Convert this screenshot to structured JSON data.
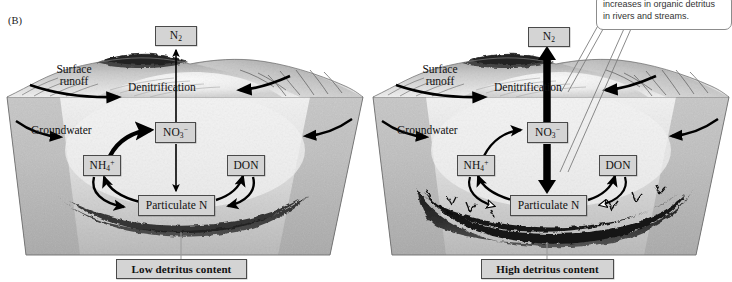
{
  "figure": {
    "panel_letter": "(B)",
    "background_color": "#ffffff",
    "box_fill": "#d4d4d4",
    "box_stroke": "#4a4a4a",
    "arrow_color": "#000000"
  },
  "callout": {
    "text": "increases in organic detritus in rivers and streams.",
    "line1": "increases in organic detritus",
    "line2": "in rivers and streams."
  },
  "panels": [
    {
      "id": "low-detritus",
      "caption": "Low detritus content",
      "detritus_level": "low",
      "labels": {
        "surface_runoff_line1": "Surface",
        "surface_runoff_line2": "runoff",
        "denitrification": "Denitrification",
        "groundwater": "Groundwater"
      },
      "pools": [
        {
          "name": "n2",
          "label": "N2",
          "html": "N<sub>2</sub>"
        },
        {
          "name": "nitrate",
          "label": "NO3-",
          "html": "NO<sub>3</sub><sup>−</sup>"
        },
        {
          "name": "ammonium",
          "label": "NH4+",
          "html": "NH<sub>4</sub><sup>+</sup>"
        },
        {
          "name": "don",
          "label": "DON",
          "html": "DON"
        },
        {
          "name": "particulate-n",
          "label": "Particulate N",
          "html": "Particulate N"
        }
      ],
      "flows": [
        {
          "from": "nitrate",
          "to": "n2",
          "weight": "thin"
        },
        {
          "from": "ammonium",
          "to": "nitrate",
          "weight": "thick"
        },
        {
          "from": "nitrate",
          "to": "particulate-n",
          "weight": "thin"
        },
        {
          "from": "particulate-n",
          "to": "ammonium",
          "weight": "thin"
        },
        {
          "from": "ammonium",
          "to": "particulate-n",
          "weight": "thin"
        },
        {
          "from": "particulate-n",
          "to": "don",
          "weight": "thin"
        },
        {
          "from": "don",
          "to": "particulate-n",
          "weight": "thin"
        }
      ]
    },
    {
      "id": "high-detritus",
      "caption": "High detritus content",
      "detritus_level": "high",
      "labels": {
        "surface_runoff_line1": "Surface",
        "surface_runoff_line2": "runoff",
        "denitrification": "Denitrification",
        "groundwater": "Groundwater"
      },
      "pools": [
        {
          "name": "n2",
          "label": "N2",
          "html": "N<sub>2</sub>"
        },
        {
          "name": "nitrate",
          "label": "NO3-",
          "html": "NO<sub>3</sub><sup>−</sup>"
        },
        {
          "name": "ammonium",
          "label": "NH4+",
          "html": "NH<sub>4</sub><sup>+</sup>"
        },
        {
          "name": "don",
          "label": "DON",
          "html": "DON"
        },
        {
          "name": "particulate-n",
          "label": "Particulate N",
          "html": "Particulate N"
        }
      ],
      "flows": [
        {
          "from": "nitrate",
          "to": "n2",
          "weight": "very-thick"
        },
        {
          "from": "ammonium",
          "to": "nitrate",
          "weight": "thin"
        },
        {
          "from": "nitrate",
          "to": "particulate-n",
          "weight": "very-thick"
        },
        {
          "from": "particulate-n",
          "to": "ammonium",
          "weight": "thin"
        },
        {
          "from": "ammonium",
          "to": "particulate-n",
          "weight": "hollow"
        },
        {
          "from": "particulate-n",
          "to": "don",
          "weight": "thin"
        },
        {
          "from": "don",
          "to": "particulate-n",
          "weight": "hollow"
        }
      ]
    }
  ]
}
